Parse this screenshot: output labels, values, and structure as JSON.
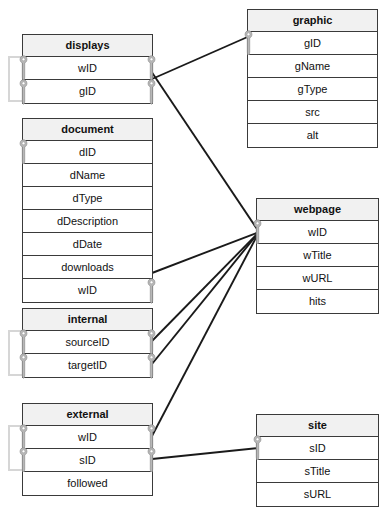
{
  "diagram": {
    "background_color": "#ffffff",
    "line_color": "#1a1a1a",
    "header_fill": "#f1f1f1",
    "key_color": "#b8b8b8",
    "selfloop_color": "#d6d6d6"
  },
  "tables": [
    {
      "id": "displays",
      "name": "displays",
      "x": 22,
      "y": 34,
      "w": 131,
      "selfloop": {
        "x": 8,
        "y": 56,
        "w": 16,
        "h": 46
      },
      "rows": [
        {
          "label": "wID",
          "key_left": true,
          "key_right": true
        },
        {
          "label": "gID",
          "key_left": true,
          "key_right": true
        }
      ]
    },
    {
      "id": "document",
      "name": "document",
      "x": 22,
      "y": 118,
      "w": 131,
      "selfloop": null,
      "rows": [
        {
          "label": "dID",
          "key_left": true,
          "key_right": false
        },
        {
          "label": "dName",
          "key_left": false,
          "key_right": false
        },
        {
          "label": "dType",
          "key_left": false,
          "key_right": false
        },
        {
          "label": "dDescription",
          "key_left": false,
          "key_right": false
        },
        {
          "label": "dDate",
          "key_left": false,
          "key_right": false
        },
        {
          "label": "downloads",
          "key_left": false,
          "key_right": false
        },
        {
          "label": "wID",
          "key_left": false,
          "key_right": true
        }
      ]
    },
    {
      "id": "internal",
      "name": "internal",
      "x": 22,
      "y": 308,
      "w": 131,
      "selfloop": {
        "x": 8,
        "y": 330,
        "w": 16,
        "h": 46
      },
      "rows": [
        {
          "label": "sourceID",
          "key_left": true,
          "key_right": true
        },
        {
          "label": "targetID",
          "key_left": true,
          "key_right": true
        }
      ]
    },
    {
      "id": "external",
      "name": "external",
      "x": 22,
      "y": 403,
      "w": 131,
      "selfloop": {
        "x": 8,
        "y": 425,
        "w": 16,
        "h": 46
      },
      "rows": [
        {
          "label": "wID",
          "key_left": true,
          "key_right": true
        },
        {
          "label": "sID",
          "key_left": true,
          "key_right": true
        },
        {
          "label": "followed",
          "key_left": false,
          "key_right": false
        }
      ]
    },
    {
      "id": "graphic",
      "name": "graphic",
      "x": 247,
      "y": 9,
      "w": 131,
      "selfloop": null,
      "rows": [
        {
          "label": "gID",
          "key_left": true,
          "key_right": false
        },
        {
          "label": "gName",
          "key_left": false,
          "key_right": false
        },
        {
          "label": "gType",
          "key_left": false,
          "key_right": false
        },
        {
          "label": "src",
          "key_left": false,
          "key_right": false
        },
        {
          "label": "alt",
          "key_left": false,
          "key_right": false
        }
      ]
    },
    {
      "id": "webpage",
      "name": "webpage",
      "x": 256,
      "y": 198,
      "w": 123,
      "selfloop": null,
      "rows": [
        {
          "label": "wID",
          "key_left": true,
          "key_right": false
        },
        {
          "label": "wTitle",
          "key_left": false,
          "key_right": false
        },
        {
          "label": "wURL",
          "key_left": false,
          "key_right": false
        },
        {
          "label": "hits",
          "key_left": false,
          "key_right": false
        }
      ]
    },
    {
      "id": "site",
      "name": "site",
      "x": 256,
      "y": 414,
      "w": 123,
      "selfloop": null,
      "rows": [
        {
          "label": "sID",
          "key_left": true,
          "key_right": false
        },
        {
          "label": "sTitle",
          "key_left": false,
          "key_right": false
        },
        {
          "label": "sURL",
          "key_left": false,
          "key_right": false
        }
      ]
    }
  ],
  "relationships": [
    {
      "id": "displays-gID-to-graphic-gID",
      "from": "displays.gID",
      "to": "graphic.gID",
      "x1": 152,
      "y1": 79,
      "x2": 252,
      "y2": 35
    },
    {
      "id": "displays-wID-to-webpage-wID",
      "from": "displays.wID",
      "to": "webpage.wID",
      "x1": 149,
      "y1": 68,
      "x2": 259,
      "y2": 232
    },
    {
      "id": "document-wID-to-webpage-wID",
      "from": "document.wID",
      "to": "webpage.wID",
      "x1": 152,
      "y1": 273,
      "x2": 259,
      "y2": 232
    },
    {
      "id": "internal-sourceID-to-webpage-wID",
      "from": "internal.sourceID",
      "to": "webpage.wID",
      "x1": 152,
      "y1": 341,
      "x2": 259,
      "y2": 232
    },
    {
      "id": "internal-targetID-to-webpage-wID",
      "from": "internal.targetID",
      "to": "webpage.wID",
      "x1": 152,
      "y1": 364,
      "x2": 259,
      "y2": 232
    },
    {
      "id": "external-wID-to-webpage-wID",
      "from": "external.wID",
      "to": "webpage.wID",
      "x1": 152,
      "y1": 436,
      "x2": 259,
      "y2": 232
    },
    {
      "id": "external-sID-to-site-sID",
      "from": "external.sID",
      "to": "site.sID",
      "x1": 152,
      "y1": 459,
      "x2": 259,
      "y2": 448
    }
  ]
}
